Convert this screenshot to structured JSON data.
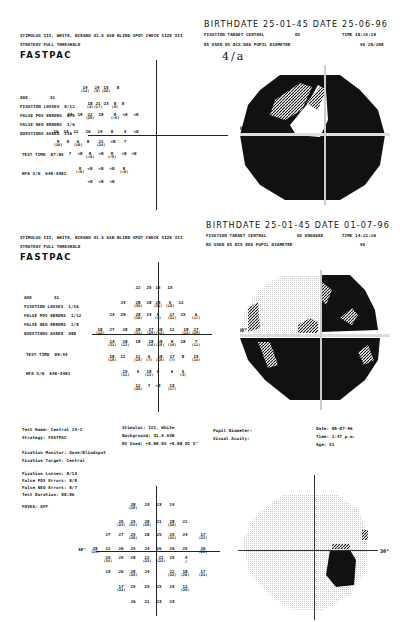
{
  "report1": {
    "stimulus_line": "STIMULUS  III, WHITE, BCKGND 31.5 ASB  BLIND SPOT CHECK SIZE  III",
    "strategy_line": "STRATEGY   FULL THRESHOLD",
    "program": "FASTPAC",
    "birthdate_line": "BIRTHDATE   25-01-45  DATE   25-06-96",
    "fixation_line": "FIXATION TARGET    CENTRAL",
    "eye": "OS",
    "time_line": "TIME  10:25:19",
    "rx_line": "RX USED      DS       DCX       DEG     PUPIL DIAMETER",
    "va_line": "VA  20/200",
    "handwritten": "4/a",
    "stats": [
      {
        "label": "AGE",
        "value": "51"
      },
      {
        "label": "FIXATION LOSSES",
        "value": "0/12"
      },
      {
        "label": "FALSE POS ERRORS",
        "value": "0/5"
      },
      {
        "label": "FALSE NEG ERRORS",
        "value": "1/6"
      },
      {
        "label": "QUESTIONS ASKED",
        "value": "216"
      },
      {
        "label": "TEST TIME",
        "value": "07:05"
      },
      {
        "label": "HFA S/N",
        "value": "640-3401"
      }
    ],
    "grid_values": [
      {
        "x": 85,
        "y": 86,
        "v": "14",
        "s": "(14)"
      },
      {
        "x": 97,
        "y": 86,
        "v": "24",
        "s": "(8)"
      },
      {
        "x": 106,
        "y": 86,
        "v": "15",
        "s": "(20)"
      },
      {
        "x": 118,
        "y": 86,
        "v": "0",
        "s": ""
      },
      {
        "x": 90,
        "y": 102,
        "v": "18",
        "s": "(4)"
      },
      {
        "x": 98,
        "y": 102,
        "v": "21",
        "s": "(17)"
      },
      {
        "x": 106,
        "y": 102,
        "v": "23",
        "s": ""
      },
      {
        "x": 115,
        "y": 102,
        "v": "0",
        "s": "(0)"
      },
      {
        "x": 123,
        "y": 102,
        "v": "0",
        "s": ""
      },
      {
        "x": 70,
        "y": 113,
        "v": "18",
        "s": ""
      },
      {
        "x": 80,
        "y": 113,
        "v": "19",
        "s": ""
      },
      {
        "x": 90,
        "y": 113,
        "v": "22",
        "s": "(29)"
      },
      {
        "x": 101,
        "y": 113,
        "v": "19",
        "s": ""
      },
      {
        "x": 115,
        "y": 113,
        "v": "0",
        "s": "(<0)"
      },
      {
        "x": 125,
        "y": 113,
        "v": "<0",
        "s": ""
      },
      {
        "x": 136,
        "y": 113,
        "v": "<0",
        "s": ""
      },
      {
        "x": 56,
        "y": 130,
        "v": "16",
        "s": ""
      },
      {
        "x": 66,
        "y": 130,
        "v": "13",
        "s": ""
      },
      {
        "x": 76,
        "y": 130,
        "v": "22",
        "s": ""
      },
      {
        "x": 88,
        "y": 130,
        "v": "26",
        "s": ""
      },
      {
        "x": 100,
        "y": 130,
        "v": "24",
        "s": ""
      },
      {
        "x": 112,
        "y": 130,
        "v": "0",
        "s": ""
      },
      {
        "x": 125,
        "y": 130,
        "v": "3",
        "s": ""
      },
      {
        "x": 136,
        "y": 130,
        "v": "<0",
        "s": ""
      },
      {
        "x": 58,
        "y": 140,
        "v": "9",
        "s": "(10)"
      },
      {
        "x": 68,
        "y": 140,
        "v": "0",
        "s": ""
      },
      {
        "x": 78,
        "y": 140,
        "v": "6",
        "s": "(10)"
      },
      {
        "x": 88,
        "y": 140,
        "v": "0",
        "s": ""
      },
      {
        "x": 101,
        "y": 140,
        "v": "21",
        "s": "(24)"
      },
      {
        "x": 113,
        "y": 140,
        "v": "<0",
        "s": ""
      },
      {
        "x": 125,
        "y": 140,
        "v": "7",
        "s": ""
      },
      {
        "x": 70,
        "y": 152,
        "v": "7",
        "s": ""
      },
      {
        "x": 80,
        "y": 152,
        "v": "<0",
        "s": ""
      },
      {
        "x": 90,
        "y": 152,
        "v": "0",
        "s": "(<0)"
      },
      {
        "x": 101,
        "y": 152,
        "v": "<0",
        "s": ""
      },
      {
        "x": 112,
        "y": 152,
        "v": "0",
        "s": "(<0)"
      },
      {
        "x": 124,
        "y": 152,
        "v": "<0",
        "s": ""
      },
      {
        "x": 134,
        "y": 152,
        "v": "<0",
        "s": ""
      },
      {
        "x": 80,
        "y": 167,
        "v": "0",
        "s": "(<0)"
      },
      {
        "x": 90,
        "y": 167,
        "v": "<0",
        "s": ""
      },
      {
        "x": 101,
        "y": 167,
        "v": "<0",
        "s": ""
      },
      {
        "x": 112,
        "y": 167,
        "v": "<0",
        "s": ""
      },
      {
        "x": 124,
        "y": 167,
        "v": "0",
        "s": "(<0)"
      },
      {
        "x": 90,
        "y": 180,
        "v": "<0",
        "s": ""
      },
      {
        "x": 101,
        "y": 180,
        "v": "<0",
        "s": ""
      },
      {
        "x": 112,
        "y": 180,
        "v": "<0",
        "s": ""
      }
    ]
  },
  "report2": {
    "stimulus_line": "STIMULUS  III, WHITE, BCKGND 31.5 ASB  BLIND SPOT CHECK SIZE  III",
    "strategy_line": "STRATEGY   FULL THRESHOLD",
    "program": "FASTPAC",
    "birthdate_line": "BIRTHDATE   25-01-45  DATE   01-07-96",
    "fixation_line": "FIXATION TARGET    CENTRAL",
    "eye": "OS ENGAGED",
    "time_line": "TIME  14:21:26",
    "rx_line": "RX USED      DS       DCX       DEG     PUPIL DIAMETER",
    "va_line": "VA",
    "stats": [
      {
        "label": "AGE",
        "value": "51"
      },
      {
        "label": "FIXATION LOSSES",
        "value": "1/16"
      },
      {
        "label": "FALSE POS ERRORS",
        "value": "1/12"
      },
      {
        "label": "FALSE NEG ERRORS",
        "value": "2/8"
      },
      {
        "label": "QUESTIONS ASKED",
        "value": "300"
      },
      {
        "label": "TEST TIME",
        "value": "09:54"
      },
      {
        "label": "HFA S/N",
        "value": "640-3401"
      }
    ],
    "grid_values": [
      {
        "x": 138,
        "y": 286,
        "v": "22",
        "s": ""
      },
      {
        "x": 149,
        "y": 286,
        "v": "25",
        "s": ""
      },
      {
        "x": 158,
        "y": 286,
        "v": "15",
        "s": ""
      },
      {
        "x": 170,
        "y": 286,
        "v": "15",
        "s": ""
      },
      {
        "x": 123,
        "y": 301,
        "v": "24",
        "s": ""
      },
      {
        "x": 138,
        "y": 301,
        "v": "28",
        "s": "(30)"
      },
      {
        "x": 149,
        "y": 301,
        "v": "28",
        "s": ""
      },
      {
        "x": 158,
        "y": 301,
        "v": "24",
        "s": "(31)"
      },
      {
        "x": 170,
        "y": 301,
        "v": "5",
        "s": "(18)"
      },
      {
        "x": 181,
        "y": 301,
        "v": "11",
        "s": ""
      },
      {
        "x": 112,
        "y": 313,
        "v": "23",
        "s": ""
      },
      {
        "x": 123,
        "y": 313,
        "v": "29",
        "s": ""
      },
      {
        "x": 138,
        "y": 313,
        "v": "28",
        "s": "(30)"
      },
      {
        "x": 149,
        "y": 313,
        "v": "24",
        "s": ""
      },
      {
        "x": 158,
        "y": 313,
        "v": "0",
        "s": "(4)"
      },
      {
        "x": 172,
        "y": 313,
        "v": "17",
        "s": "(21)"
      },
      {
        "x": 183,
        "y": 313,
        "v": "15",
        "s": ""
      },
      {
        "x": 196,
        "y": 313,
        "v": "6",
        "s": "(17)"
      },
      {
        "x": 100,
        "y": 328,
        "v": "18",
        "s": "(12)"
      },
      {
        "x": 112,
        "y": 328,
        "v": "27",
        "s": ""
      },
      {
        "x": 125,
        "y": 328,
        "v": "28",
        "s": ""
      },
      {
        "x": 138,
        "y": 328,
        "v": "28",
        "s": "(31)"
      },
      {
        "x": 151,
        "y": 328,
        "v": "27",
        "s": "(29)"
      },
      {
        "x": 160,
        "y": 328,
        "v": "18",
        "s": "(12)"
      },
      {
        "x": 172,
        "y": 328,
        "v": "11",
        "s": ""
      },
      {
        "x": 186,
        "y": 328,
        "v": "18",
        "s": "(15)"
      },
      {
        "x": 196,
        "y": 328,
        "v": "27",
        "s": "(29)"
      },
      {
        "x": 112,
        "y": 340,
        "v": "13",
        "s": "(31)"
      },
      {
        "x": 125,
        "y": 340,
        "v": "18",
        "s": "(12)"
      },
      {
        "x": 138,
        "y": 340,
        "v": "18",
        "s": ""
      },
      {
        "x": 151,
        "y": 340,
        "v": "18",
        "s": "(16)"
      },
      {
        "x": 160,
        "y": 340,
        "v": "18",
        "s": "(18)"
      },
      {
        "x": 172,
        "y": 340,
        "v": "9",
        "s": "(16)"
      },
      {
        "x": 183,
        "y": 340,
        "v": "18",
        "s": ""
      },
      {
        "x": 196,
        "y": 340,
        "v": "7",
        "s": "(11)"
      },
      {
        "x": 112,
        "y": 355,
        "v": "18",
        "s": "(18)"
      },
      {
        "x": 123,
        "y": 355,
        "v": "12",
        "s": ""
      },
      {
        "x": 138,
        "y": 355,
        "v": "12",
        "s": "(18)"
      },
      {
        "x": 149,
        "y": 355,
        "v": "6",
        "s": "(7)"
      },
      {
        "x": 160,
        "y": 355,
        "v": "18",
        "s": "(18)"
      },
      {
        "x": 172,
        "y": 355,
        "v": "17",
        "s": "(7)"
      },
      {
        "x": 183,
        "y": 355,
        "v": "8",
        "s": ""
      },
      {
        "x": 196,
        "y": 355,
        "v": "15",
        "s": "(15)"
      },
      {
        "x": 125,
        "y": 370,
        "v": "15",
        "s": "(15)"
      },
      {
        "x": 138,
        "y": 370,
        "v": "5",
        "s": ""
      },
      {
        "x": 149,
        "y": 370,
        "v": "18",
        "s": "(15)"
      },
      {
        "x": 158,
        "y": 370,
        "v": "6",
        "s": ""
      },
      {
        "x": 172,
        "y": 370,
        "v": "6",
        "s": ""
      },
      {
        "x": 183,
        "y": 370,
        "v": "5",
        "s": "(3)"
      },
      {
        "x": 138,
        "y": 384,
        "v": "12",
        "s": "(20)"
      },
      {
        "x": 149,
        "y": 384,
        "v": "7",
        "s": ""
      },
      {
        "x": 158,
        "y": 384,
        "v": "<0",
        "s": ""
      },
      {
        "x": 172,
        "y": 384,
        "v": "13",
        "s": "(17)"
      }
    ]
  },
  "report3": {
    "left_info": [
      {
        "label": "Test Name:",
        "value": "Central 24-2"
      },
      {
        "label": "Strategy:",
        "value": "FASTPAC"
      },
      {
        "label": "Fixation Monitor:",
        "value": "Gaze/Blindspot"
      },
      {
        "label": "Fixation Target:",
        "value": "Central"
      },
      {
        "label": "Fixation Losses:",
        "value": "0/13"
      },
      {
        "label": "False POS Errors:",
        "value": "0/8"
      },
      {
        "label": "False NEG Errors:",
        "value": "0/7"
      },
      {
        "label": "Test Duration:",
        "value": "08:06"
      },
      {
        "label": "FOVEA:",
        "value": "OFF"
      }
    ],
    "mid_info": [
      {
        "label": "Stimulus:",
        "value": "III, White"
      },
      {
        "label": "Background:",
        "value": "31.5 ASB"
      },
      {
        "label": "RX Used:",
        "value": "+0.00 DS  +0.00 DC   X°"
      }
    ],
    "pupil_info": [
      {
        "label": "Pupil Diameter:",
        "value": ""
      },
      {
        "label": "Visual Acuity:",
        "value": ""
      }
    ],
    "right_info": [
      {
        "label": "Date:",
        "value": "08-07-96"
      },
      {
        "label": "Time:",
        "value": "1:47 p.m."
      },
      {
        "label": "Age:",
        "value": "51"
      }
    ],
    "axis_label": "30°",
    "grid_values": [
      {
        "x": 133,
        "y": 503,
        "v": "28",
        "s": "(28)"
      },
      {
        "x": 147,
        "y": 503,
        "v": "23",
        "s": ""
      },
      {
        "x": 159,
        "y": 503,
        "v": "23",
        "s": ""
      },
      {
        "x": 172,
        "y": 503,
        "v": "24",
        "s": ""
      },
      {
        "x": 121,
        "y": 520,
        "v": "25",
        "s": "(23)"
      },
      {
        "x": 133,
        "y": 520,
        "v": "25",
        "s": "(25)"
      },
      {
        "x": 147,
        "y": 520,
        "v": "28",
        "s": "(28)"
      },
      {
        "x": 159,
        "y": 520,
        "v": "21",
        "s": ""
      },
      {
        "x": 172,
        "y": 520,
        "v": "28",
        "s": "(28)"
      },
      {
        "x": 185,
        "y": 520,
        "v": "22",
        "s": ""
      },
      {
        "x": 108,
        "y": 533,
        "v": "27",
        "s": ""
      },
      {
        "x": 121,
        "y": 533,
        "v": "27",
        "s": ""
      },
      {
        "x": 133,
        "y": 533,
        "v": "25",
        "s": "(28)"
      },
      {
        "x": 147,
        "y": 533,
        "v": "28",
        "s": ""
      },
      {
        "x": 159,
        "y": 533,
        "v": "25",
        "s": ""
      },
      {
        "x": 172,
        "y": 533,
        "v": "25",
        "s": "(25)"
      },
      {
        "x": 185,
        "y": 533,
        "v": "24",
        "s": ""
      },
      {
        "x": 203,
        "y": 533,
        "v": "17",
        "s": "(23)"
      },
      {
        "x": 95,
        "y": 547,
        "v": "28",
        "s": "(25)"
      },
      {
        "x": 108,
        "y": 547,
        "v": "22",
        "s": ""
      },
      {
        "x": 121,
        "y": 547,
        "v": "26",
        "s": ""
      },
      {
        "x": 133,
        "y": 547,
        "v": "25",
        "s": ""
      },
      {
        "x": 147,
        "y": 547,
        "v": "24",
        "s": ""
      },
      {
        "x": 159,
        "y": 547,
        "v": "26",
        "s": ""
      },
      {
        "x": 172,
        "y": 547,
        "v": "26",
        "s": ""
      },
      {
        "x": 185,
        "y": 547,
        "v": "25",
        "s": ""
      },
      {
        "x": 203,
        "y": 547,
        "v": "26",
        "s": "(25)"
      },
      {
        "x": 108,
        "y": 556,
        "v": "25",
        "s": "(25)"
      },
      {
        "x": 121,
        "y": 556,
        "v": "25",
        "s": ""
      },
      {
        "x": 133,
        "y": 556,
        "v": "28",
        "s": ""
      },
      {
        "x": 147,
        "y": 556,
        "v": "22",
        "s": "(22)"
      },
      {
        "x": 161,
        "y": 556,
        "v": "22",
        "s": "(22)"
      },
      {
        "x": 172,
        "y": 556,
        "v": "25",
        "s": ""
      },
      {
        "x": 186,
        "y": 556,
        "v": "4",
        "s": "△"
      },
      {
        "x": 108,
        "y": 570,
        "v": "23",
        "s": ""
      },
      {
        "x": 121,
        "y": 570,
        "v": "26",
        "s": ""
      },
      {
        "x": 133,
        "y": 570,
        "v": "28",
        "s": "(28)"
      },
      {
        "x": 147,
        "y": 570,
        "v": "24",
        "s": ""
      },
      {
        "x": 172,
        "y": 570,
        "v": "22",
        "s": "(22)"
      },
      {
        "x": 185,
        "y": 570,
        "v": "18",
        "s": "(20)"
      },
      {
        "x": 203,
        "y": 570,
        "v": "17",
        "s": "(24)"
      },
      {
        "x": 121,
        "y": 585,
        "v": "17",
        "s": "(24)"
      },
      {
        "x": 133,
        "y": 585,
        "v": "25",
        "s": ""
      },
      {
        "x": 147,
        "y": 585,
        "v": "25",
        "s": ""
      },
      {
        "x": 159,
        "y": 585,
        "v": "25",
        "s": ""
      },
      {
        "x": 172,
        "y": 585,
        "v": "25",
        "s": ""
      },
      {
        "x": 185,
        "y": 585,
        "v": "11",
        "s": "(20)"
      },
      {
        "x": 133,
        "y": 600,
        "v": "26",
        "s": ""
      },
      {
        "x": 147,
        "y": 600,
        "v": "21",
        "s": ""
      },
      {
        "x": 159,
        "y": 600,
        "v": "23",
        "s": ""
      },
      {
        "x": 172,
        "y": 600,
        "v": "23",
        "s": ""
      }
    ]
  },
  "fields": {
    "axis_label": "30°",
    "colors": {
      "dark": "#111111",
      "light": "#cfcfcf",
      "paper": "#ffffff"
    }
  }
}
